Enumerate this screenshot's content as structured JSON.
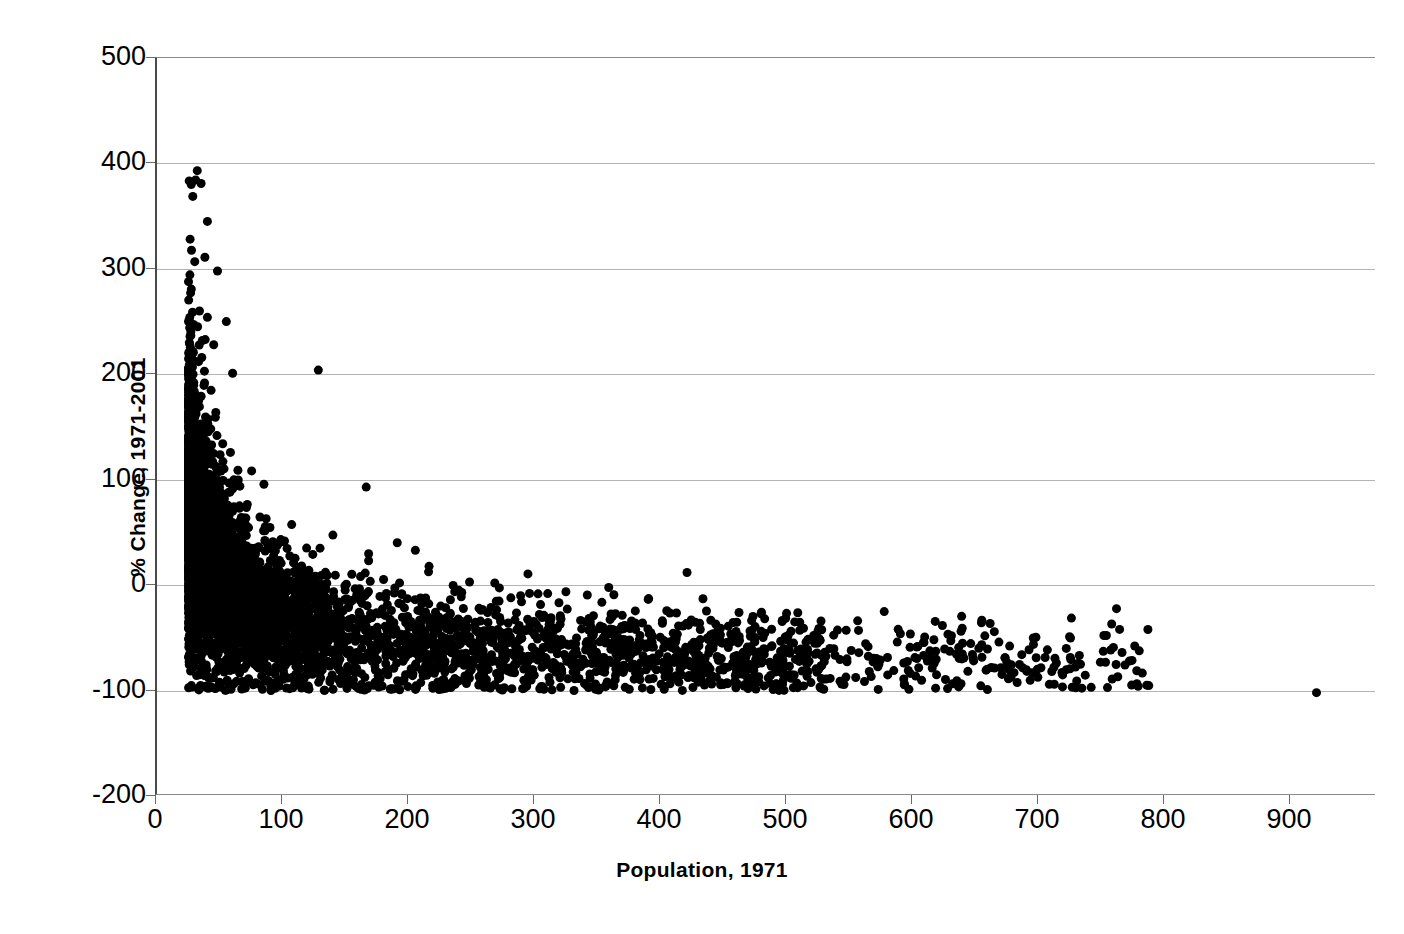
{
  "chart_data": {
    "type": "scatter",
    "title": "",
    "xlabel": "Population, 1971",
    "ylabel": "% Change, 1971-2001",
    "xlim": [
      0,
      968
    ],
    "ylim": [
      -200,
      500
    ],
    "xticks": [
      0,
      100,
      200,
      300,
      400,
      500,
      600,
      700,
      800,
      900
    ],
    "yticks": [
      500,
      400,
      300,
      200,
      100,
      0,
      -100,
      -200
    ],
    "xtick_labels": [
      "0",
      "100",
      "200",
      "300",
      "400",
      "500",
      "600",
      "700",
      "800",
      "900"
    ],
    "ytick_labels": [
      "500",
      "400",
      "300",
      "200",
      "100",
      "0",
      "-100",
      "-200"
    ],
    "grid": "horizontal",
    "grid_color": "#b4b4b4",
    "marker_color": "#000000",
    "marker_size_px": 9,
    "marker_shape": "circle",
    "legend": "none",
    "n_points_approx": 3800,
    "notable_points": [
      {
        "x": 35,
        "y": 381,
        "label": "highest-change-outlier"
      },
      {
        "x": 40,
        "y": 345
      },
      {
        "x": 38,
        "y": 311
      },
      {
        "x": 48,
        "y": 298
      },
      {
        "x": 40,
        "y": 254
      },
      {
        "x": 55,
        "y": 250
      },
      {
        "x": 36,
        "y": 232
      },
      {
        "x": 45,
        "y": 228
      },
      {
        "x": 33,
        "y": 212
      },
      {
        "x": 60,
        "y": 201
      },
      {
        "x": 128,
        "y": 204,
        "label": "isolated-mid-population-high-change"
      },
      {
        "x": 166,
        "y": 93
      },
      {
        "x": 920,
        "y": -102,
        "label": "largest-population-outlier"
      },
      {
        "x": 515,
        "y": -81
      },
      {
        "x": 485,
        "y": -88
      },
      {
        "x": 432,
        "y": -85
      },
      {
        "x": 405,
        "y": -68
      },
      {
        "x": 205,
        "y": 33
      },
      {
        "x": 248,
        "y": 3
      },
      {
        "x": 268,
        "y": 2
      },
      {
        "x": 310,
        "y": -8
      }
    ],
    "series": [
      {
        "name": "settlements",
        "x_range": [
          25,
          920
        ],
        "y_range": [
          -100,
          381
        ],
        "trend": "decaying-hyperbolic"
      }
    ]
  },
  "axes": {
    "x_title": "Population, 1971",
    "y_title": "% Change, 1971-2001"
  }
}
